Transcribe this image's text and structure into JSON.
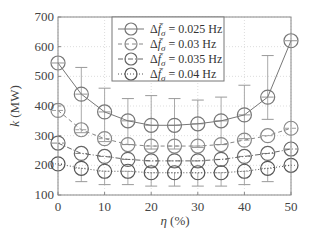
{
  "chart_data": {
    "type": "line",
    "title": "",
    "xlabel": "η (%)",
    "ylabel": "k (MW)",
    "xlim": [
      0,
      50
    ],
    "ylim": [
      100,
      700
    ],
    "x_ticks": [
      0,
      10,
      20,
      30,
      40,
      50
    ],
    "y_ticks": [
      100,
      200,
      300,
      400,
      500,
      600,
      700
    ],
    "grid": true,
    "legend_position": "upper center",
    "x": [
      0,
      5,
      10,
      15,
      20,
      25,
      30,
      35,
      40,
      45,
      50
    ],
    "series": [
      {
        "name": "Δf̄σ = 0.025 Hz",
        "label_prefix": "Δf",
        "label_sub": "σ",
        "label_value": " = 0.025 Hz",
        "line_style": "solid",
        "color": "#777777",
        "values": [
          545,
          440,
          380,
          350,
          335,
          335,
          340,
          350,
          370,
          430,
          620
        ],
        "err_low": [
          null,
          130,
          100,
          80,
          80,
          80,
          80,
          80,
          80,
          75,
          null
        ],
        "err_high": [
          null,
          90,
          80,
          75,
          100,
          90,
          80,
          80,
          100,
          140,
          null
        ]
      },
      {
        "name": "Δf̄σ = 0.03 Hz",
        "label_prefix": "Δf",
        "label_sub": "σ",
        "label_value": " = 0.03 Hz",
        "line_style": "dashed",
        "color": "#888888",
        "values": [
          385,
          320,
          290,
          270,
          265,
          265,
          265,
          270,
          285,
          300,
          325
        ],
        "err_low": [],
        "err_high": []
      },
      {
        "name": "Δf̄σ = 0.035 Hz",
        "label_prefix": "Δf",
        "label_sub": "σ",
        "label_value": " = 0.035 Hz",
        "line_style": "dashdot",
        "color": "#666666",
        "values": [
          275,
          240,
          230,
          220,
          215,
          215,
          215,
          220,
          230,
          240,
          255
        ],
        "err_low": [],
        "err_high": []
      },
      {
        "name": "Δf̄σ = 0.04 Hz",
        "label_prefix": "Δf",
        "label_sub": "σ",
        "label_value": " = 0.04 Hz",
        "line_style": "dotted",
        "color": "#555555",
        "values": [
          205,
          190,
          180,
          180,
          175,
          175,
          175,
          175,
          180,
          190,
          200
        ],
        "err_low": [
          null,
          45,
          45,
          45,
          45,
          45,
          45,
          45,
          45,
          45,
          null
        ],
        "err_high": []
      }
    ]
  }
}
